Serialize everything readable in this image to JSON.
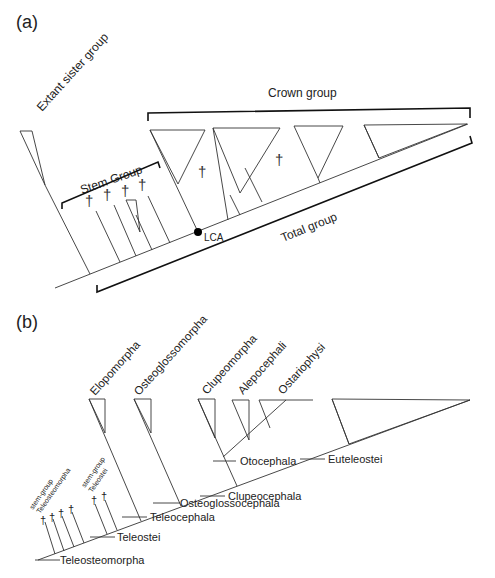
{
  "panel_a": {
    "label": "(a)",
    "extant_sister": "Extant sister group",
    "crown": "Crown group",
    "stem": "Stem Group",
    "total": "Total group",
    "lca": "LCA",
    "dagger": "†"
  },
  "panel_b": {
    "label": "(b)",
    "clades": [
      "Elopomorpha",
      "Osteoglossomorpha",
      "Clupeomorpha",
      "Alepocephali",
      "Ostariophysi"
    ],
    "nodes": [
      "Teleosteomorpha",
      "Teleostei",
      "Teleocephala",
      "Osteoglossocephala",
      "Clupeocephala",
      "Otocephala",
      "Euteleostei"
    ],
    "stem_teleosteomorpha": [
      "stem-group",
      "Teleosteomorpha"
    ],
    "stem_teleostei": [
      "stem-group",
      "Teleostei"
    ],
    "dagger": "†"
  }
}
